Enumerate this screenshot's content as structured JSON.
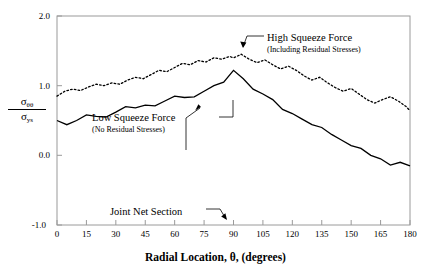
{
  "chart_data": {
    "type": "line",
    "title": "",
    "xlabel": "Radial Location, θ, (degrees)",
    "ylabel": "σθθ / σys",
    "xlim": [
      0,
      180
    ],
    "ylim": [
      -1.0,
      2.0
    ],
    "xticks": [
      "0",
      "15",
      "30",
      "45",
      "60",
      "75",
      "90",
      "105",
      "120",
      "135",
      "150",
      "165",
      "180"
    ],
    "yticks": [
      "2.0",
      "1.0",
      "0.0",
      "-1.0"
    ],
    "grid": false,
    "legend_position": "inline-annotations",
    "series": [
      {
        "name": "High Squeeze Force (Including Residual Stresses)",
        "style": "dotted",
        "color": "#000000",
        "x": [
          0,
          4,
          8,
          12,
          16,
          20,
          24,
          28,
          32,
          36,
          40,
          44,
          48,
          52,
          56,
          60,
          64,
          68,
          72,
          76,
          80,
          84,
          88,
          90,
          94,
          98,
          102,
          106,
          110,
          114,
          118,
          122,
          126,
          130,
          134,
          138,
          142,
          146,
          150,
          154,
          158,
          162,
          166,
          170,
          174,
          178,
          180
        ],
        "y": [
          0.85,
          0.92,
          0.95,
          0.93,
          0.98,
          1.02,
          1.0,
          1.04,
          1.02,
          1.08,
          1.12,
          1.1,
          1.16,
          1.22,
          1.2,
          1.26,
          1.32,
          1.3,
          1.36,
          1.34,
          1.4,
          1.38,
          1.42,
          1.4,
          1.45,
          1.38,
          1.33,
          1.37,
          1.3,
          1.24,
          1.28,
          1.22,
          1.14,
          1.08,
          1.12,
          1.04,
          0.97,
          0.92,
          0.96,
          0.88,
          0.8,
          0.75,
          0.8,
          0.84,
          0.78,
          0.7,
          0.64
        ]
      },
      {
        "name": "Low Squeeze Force (No Residual Stresses)",
        "style": "solid",
        "color": "#000000",
        "x": [
          0,
          5,
          10,
          15,
          20,
          25,
          30,
          35,
          40,
          45,
          50,
          55,
          60,
          65,
          70,
          75,
          80,
          85,
          90,
          95,
          100,
          105,
          110,
          115,
          120,
          125,
          130,
          135,
          140,
          145,
          150,
          155,
          160,
          165,
          170,
          175,
          180
        ],
        "y": [
          0.5,
          0.44,
          0.5,
          0.58,
          0.56,
          0.55,
          0.62,
          0.7,
          0.68,
          0.72,
          0.71,
          0.78,
          0.85,
          0.83,
          0.84,
          0.92,
          1.0,
          1.05,
          1.22,
          1.1,
          0.95,
          0.88,
          0.8,
          0.66,
          0.6,
          0.52,
          0.44,
          0.4,
          0.3,
          0.22,
          0.14,
          0.1,
          0.0,
          -0.05,
          -0.14,
          -0.1,
          -0.15
        ]
      }
    ],
    "annotations": [
      {
        "id": "high-squeeze",
        "line1": "High Squeeze Force",
        "line2": "(Including Residual Stresses)"
      },
      {
        "id": "low-squeeze",
        "line1": "Low Squeeze Force",
        "line2": "(No Residual Stresses)"
      },
      {
        "id": "joint-net-section",
        "line1": "Joint Net Section"
      }
    ]
  },
  "axes": {
    "x_title": "Radial Location, θ, (degrees)",
    "y_num": "σ",
    "y_num_sub": "θθ",
    "y_den": "σ",
    "y_den_sub": "ys"
  },
  "colors": {
    "frame": "#9a9a9a",
    "curve": "#000000",
    "background": "#ffffff"
  }
}
